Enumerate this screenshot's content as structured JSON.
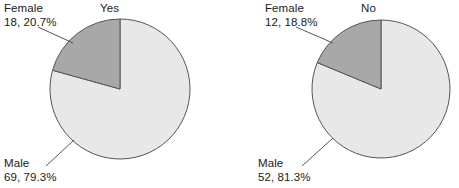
{
  "chart_data": [
    {
      "type": "pie",
      "title": "Yes",
      "categories": [
        "Female",
        "Male"
      ],
      "values": [
        18,
        69
      ],
      "percents": [
        20.7,
        79.3
      ],
      "labels": [
        {
          "name": "Female",
          "value_label": "18, 20.7%",
          "count": 18,
          "percent": 20.7,
          "color": "#a8a8a8"
        },
        {
          "name": "Male",
          "value_label": "69, 79.3%",
          "count": 69,
          "percent": 79.3,
          "color": "#e8e8e8"
        }
      ],
      "legend": "none",
      "grid": false,
      "xlabel": "",
      "ylabel": ""
    },
    {
      "type": "pie",
      "title": "No",
      "categories": [
        "Female",
        "Male"
      ],
      "values": [
        12,
        52
      ],
      "percents": [
        18.8,
        81.3
      ],
      "labels": [
        {
          "name": "Female",
          "value_label": "12, 18.8%",
          "count": 12,
          "percent": 18.8,
          "color": "#a8a8a8"
        },
        {
          "name": "Male",
          "value_label": "52, 81.3%",
          "count": 52,
          "percent": 81.3,
          "color": "#e8e8e8"
        }
      ],
      "legend": "none",
      "grid": false,
      "xlabel": "",
      "ylabel": ""
    }
  ],
  "colors": {
    "female_slice": "#a8a8a8",
    "male_slice": "#e8e8e8",
    "slice_stroke": "#555555",
    "leader_line": "#555555",
    "text": "#1a1a1a",
    "background": "#ffffff"
  },
  "charts": {
    "yes": {
      "title": "Yes",
      "female_name": "Female",
      "female_value": "18, 20.7%",
      "male_name": "Male",
      "male_value": "69, 79.3%"
    },
    "no": {
      "title": "No",
      "female_name": "Female",
      "female_value": "12, 18.8%",
      "male_name": "Male",
      "male_value": "52, 81.3%"
    }
  }
}
